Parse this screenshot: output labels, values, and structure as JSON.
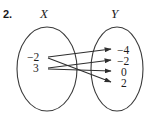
{
  "figure": {
    "problem_number": "2.",
    "type": "mapping-diagram"
  },
  "sets": {
    "x": {
      "label": "X",
      "members": [
        "−2",
        "3"
      ]
    },
    "y": {
      "label": "Y",
      "members": [
        "−4",
        "−2",
        "0",
        "2"
      ]
    }
  },
  "mappings": [
    {
      "from": "−2",
      "to": "−4"
    },
    {
      "from": "−2",
      "to": "2"
    },
    {
      "from": "3",
      "to": "−2"
    },
    {
      "from": "3",
      "to": "0"
    }
  ],
  "colors": {
    "ink": "#1c1c1c",
    "outline": "#3a3a3a",
    "arrow": "#2e2e2e",
    "background": "#ffffff"
  }
}
